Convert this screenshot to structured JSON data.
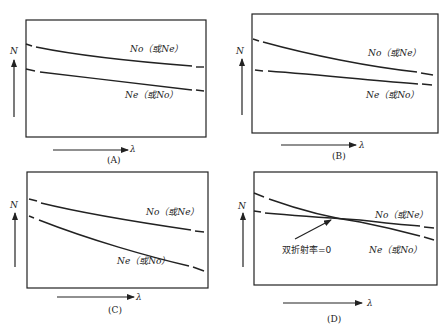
{
  "figure": {
    "panels": [
      {
        "id": "A",
        "caption": "(A)",
        "y_axis_label": "N",
        "x_axis_label": "λ",
        "curves": [
          {
            "name": "No（或Ne）",
            "label": "No（或Ne）",
            "position": "upper"
          },
          {
            "name": "Ne（或No）",
            "label": "Ne（或No）",
            "position": "lower"
          }
        ],
        "description": "Two roughly parallel decreasing curves, No above Ne"
      },
      {
        "id": "B",
        "caption": "(B)",
        "y_axis_label": "N",
        "x_axis_label": "λ",
        "curves": [
          {
            "name": "No（或Ne）",
            "label": "No（或Ne）",
            "position": "upper"
          },
          {
            "name": "Ne（或No）",
            "label": "Ne（或No）",
            "position": "lower"
          }
        ],
        "description": "Two decreasing curves converging at long wavelength"
      },
      {
        "id": "C",
        "caption": "(C)",
        "y_axis_label": "N",
        "x_axis_label": "λ",
        "curves": [
          {
            "name": "No（或Ne）",
            "label": "No（或Ne）",
            "position": "upper"
          },
          {
            "name": "Ne（或No）",
            "label": "Ne（或No）",
            "position": "lower"
          }
        ],
        "description": "Two decreasing curves diverging at long wavelength"
      },
      {
        "id": "D",
        "caption": "(D)",
        "y_axis_label": "N",
        "x_axis_label": "λ",
        "curves": [
          {
            "name": "No（或Ne）",
            "label": "No（或Ne）",
            "position": "upper-right"
          },
          {
            "name": "Ne（或No）",
            "label": "Ne（或No）",
            "position": "lower-right"
          }
        ],
        "annotation": "双折射率=0",
        "description": "Two curves crossing; birefringence equals zero at the crossing point"
      }
    ]
  }
}
